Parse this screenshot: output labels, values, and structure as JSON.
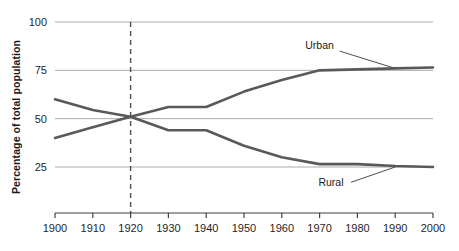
{
  "chart_data": {
    "type": "line",
    "title": "",
    "subtitle": "",
    "xlabel": "",
    "ylabel": "Percentage of total population",
    "x": [
      1900,
      1910,
      1920,
      1930,
      1940,
      1950,
      1960,
      1970,
      1980,
      1990,
      2000
    ],
    "xtick_labels": [
      "1900",
      "1910",
      "1920",
      "1930",
      "1940",
      "1950",
      "1960",
      "1970",
      "1980",
      "1990",
      "2000"
    ],
    "ytick_labels": [
      "100",
      "75",
      "50",
      "25"
    ],
    "yticks": [
      100,
      75,
      50,
      25
    ],
    "xlim": [
      1900,
      2000
    ],
    "ylim": [
      0,
      100
    ],
    "grid": "horizontal",
    "legend_position": "inline-annotations",
    "series": [
      {
        "name": "Urban",
        "label": "Urban",
        "color": "#595959",
        "values": [
          40,
          45.5,
          51,
          56,
          56,
          64,
          70,
          75,
          75.5,
          76,
          76.5
        ]
      },
      {
        "name": "Rural",
        "label": "Rural",
        "color": "#595959",
        "values": [
          60,
          54.5,
          51,
          44,
          44,
          36,
          30,
          26.5,
          26.5,
          25.5,
          25
        ]
      }
    ],
    "annotations": [
      {
        "name": "urban-series-label",
        "text": "Urban",
        "x": 1970,
        "y": 86,
        "leader_to_x": 1990,
        "leader_to_y": 76
      },
      {
        "name": "rural-series-label",
        "text": "Rural",
        "x": 1973,
        "y": 15,
        "leader_to_x": 1990,
        "leader_to_y": 25
      },
      {
        "name": "reference-line-1920",
        "text": "",
        "style": "dashed-vertical",
        "x": 1920
      }
    ],
    "colors": {
      "line": "#595959",
      "gridline": "#aaaaaa",
      "axis": "#3f3f3f",
      "text": "#262626",
      "background": "#ffffff"
    }
  }
}
